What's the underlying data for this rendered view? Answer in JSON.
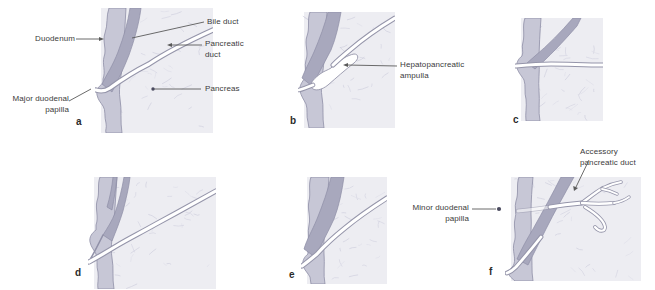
{
  "figure": {
    "panels": [
      {
        "letter": "a"
      },
      {
        "letter": "b"
      },
      {
        "letter": "c"
      },
      {
        "letter": "d"
      },
      {
        "letter": "e"
      },
      {
        "letter": "f"
      }
    ],
    "annotations": {
      "duodenum": "Duodenum",
      "bile_duct": "Bile duct",
      "pancreatic_duct": "Pancreatic duct",
      "pancreas": "Pancreas",
      "major_duodenal_papilla": "Major duodenal papilla",
      "hepatopancreatic_ampulla": "Hepatopancreatic ampulla",
      "accessory_pancreatic_duct": "Accessory pancreatic duct",
      "minor_duodenal_papilla": "Minor duodenal papilla"
    },
    "colors": {
      "pancreas_fill": "#ededf2",
      "texture_stroke": "#d6d6e2",
      "duodenum_wall_fill": "#c7c7d6",
      "duct_fill": "#a8a8bd",
      "outline": "#8e8ea6",
      "lumen": "#ffffff",
      "lumen_wall": "#9595aa",
      "text": "#3b3b3b",
      "leader": "#5a5a5a"
    }
  }
}
